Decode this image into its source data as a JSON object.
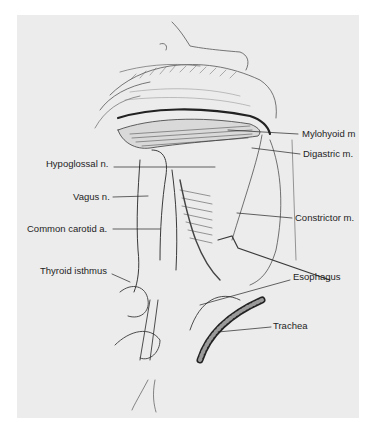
{
  "figure": {
    "background_color": "#ececec",
    "labels": {
      "mylohyoid": "Mylohyoid m",
      "digastric": "Digastric m.",
      "hypoglossal": "Hypoglossal n.",
      "vagus": "Vagus n.",
      "constrictor": "Constrictor m.",
      "common_carotid": "Common carotid a.",
      "thyroid_isthmus": "Thyroid isthmus",
      "esophagus": "Esophagus",
      "trachea": "Trachea"
    }
  }
}
